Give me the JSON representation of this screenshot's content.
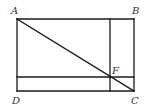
{
  "figure": {
    "width": 148,
    "height": 110,
    "stroke_color": "#1a1a1a",
    "label_color": "#333333",
    "points": {
      "A": {
        "label": "A",
        "x": 17,
        "y": 19
      },
      "B": {
        "label": "B",
        "x": 134,
        "y": 19
      },
      "C": {
        "label": "C",
        "x": 134,
        "y": 91
      },
      "D": {
        "label": "D",
        "x": 17,
        "y": 91
      },
      "F": {
        "label": "F",
        "x": 110,
        "y": 77
      }
    },
    "segments": [
      {
        "name": "AB",
        "from": "A",
        "to": "B"
      },
      {
        "name": "BC",
        "from": "B",
        "to": "C"
      },
      {
        "name": "CD",
        "from": "C",
        "to": "D"
      },
      {
        "name": "DA",
        "from": "D",
        "to": "A"
      },
      {
        "name": "AC-diagonal",
        "from": "A",
        "to": "C"
      },
      {
        "name": "vertical-through-F",
        "x": 110,
        "y1": 19,
        "y2": 91
      },
      {
        "name": "horizontal-through-F",
        "y": 77,
        "x1": 17,
        "x2": 134
      }
    ]
  }
}
